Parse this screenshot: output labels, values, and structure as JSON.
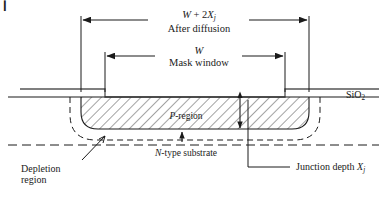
{
  "figure": {
    "type": "semiconductor-cross-section-diagram",
    "corner_mark": "▎"
  },
  "dimensions": {
    "outer": {
      "symbol_main": "W",
      "symbol_plus": " + 2",
      "symbol_var": "X",
      "symbol_sub": "j",
      "caption": "After diffusion"
    },
    "inner": {
      "symbol_main": "W",
      "caption": "Mask window"
    }
  },
  "layers": {
    "oxide": {
      "label_main": "SiO",
      "label_sub": "2"
    },
    "p_region": {
      "label_italic": "P",
      "label_rest": "-region"
    },
    "substrate": {
      "label_italic": "N",
      "label_rest": "-type substrate"
    }
  },
  "callouts": {
    "junction_depth": {
      "text": "Junction depth ",
      "symbol_var": "X",
      "symbol_sub": "j"
    },
    "depletion": {
      "line1": "Depletion",
      "line2": "region"
    }
  },
  "geometry": {
    "surface_y": 97,
    "window_left_x": 105,
    "window_right_x": 285,
    "diffusion_left_x": 81,
    "diffusion_right_x": 309,
    "junction_depth_px": 32,
    "depletion_offset_px": 11
  },
  "style": {
    "line_color": "#1a1a1a",
    "hatch_color": "#333333",
    "background": "#ffffff"
  }
}
